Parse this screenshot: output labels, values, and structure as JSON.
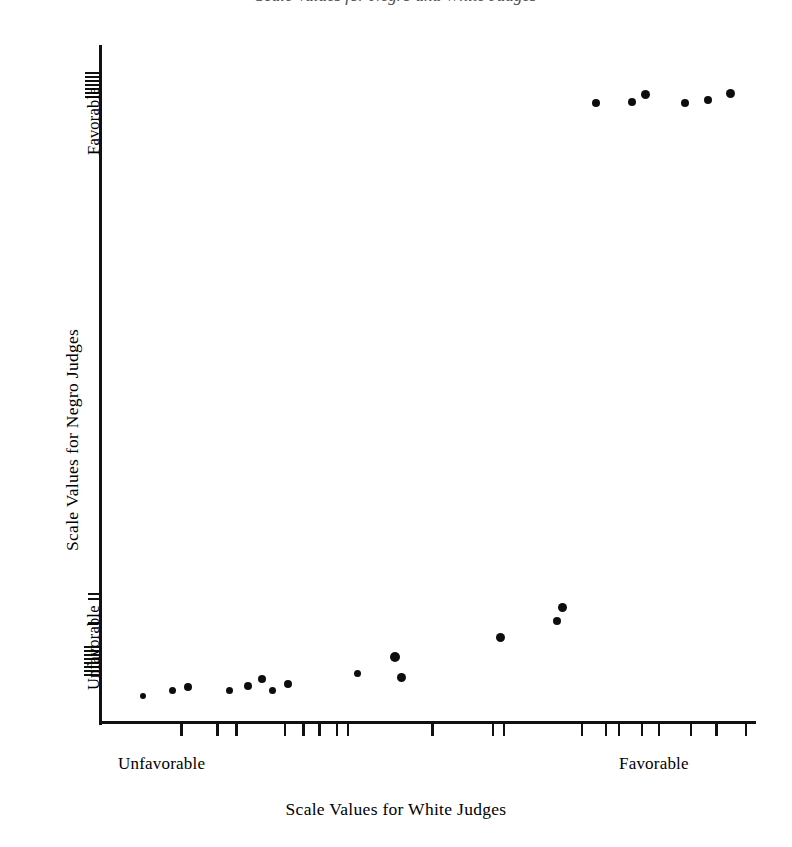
{
  "figure": {
    "title_remnant": "Scale Values for Negro and White Judges",
    "background_color": "#ffffff",
    "ink_color": "#0d0d0d"
  },
  "chart_data": {
    "type": "scatter",
    "title": "",
    "xlabel": "Scale Values for White Judges",
    "ylabel": "Scale Values for Negro Judges",
    "x_tick_labels": [
      "Unfavorable",
      "Favorable"
    ],
    "y_tick_labels": [
      "Unfavorable",
      "Favorable"
    ],
    "xlim": [
      0,
      11
    ],
    "ylim": [
      0,
      11
    ],
    "grid": false,
    "legend": null,
    "x_axis_label_positions": [
      1.1,
      8.6
    ],
    "y_axis_label_positions": [
      0.85,
      9.5
    ],
    "points": [
      {
        "x": 0.68,
        "y": 0.38
      },
      {
        "x": 1.18,
        "y": 0.48
      },
      {
        "x": 1.45,
        "y": 0.53
      },
      {
        "x": 2.14,
        "y": 0.48
      },
      {
        "x": 2.46,
        "y": 0.55
      },
      {
        "x": 2.69,
        "y": 0.66
      },
      {
        "x": 2.87,
        "y": 0.49
      },
      {
        "x": 3.14,
        "y": 0.58
      },
      {
        "x": 4.31,
        "y": 0.75
      },
      {
        "x": 4.94,
        "y": 1.01
      },
      {
        "x": 5.04,
        "y": 0.7
      },
      {
        "x": 6.72,
        "y": 1.35
      },
      {
        "x": 7.68,
        "y": 1.61
      },
      {
        "x": 7.76,
        "y": 1.84
      },
      {
        "x": 8.35,
        "y": 10.12
      },
      {
        "x": 8.94,
        "y": 10.13
      },
      {
        "x": 9.17,
        "y": 10.27
      },
      {
        "x": 9.82,
        "y": 10.12
      },
      {
        "x": 10.21,
        "y": 10.17
      },
      {
        "x": 10.58,
        "y": 10.29
      }
    ],
    "x_ticks": [
      1.2,
      2.69,
      3.46,
      5.49,
      6.25,
      6.92,
      7.64,
      8.1,
      11.57,
      14.09,
      14.55,
      17.78,
      18.77,
      19.3,
      20.25,
      20.95,
      22.29,
      23.34,
      24.56
    ],
    "y_ticks_top": [
      9.83,
      9.95,
      10.07,
      10.19,
      10.31,
      10.43,
      10.55
    ],
    "y_ticks_bottom": [
      2.15,
      2.3,
      1.66,
      0.94,
      0.84,
      0.74,
      0.64,
      0.54,
      0.44,
      0.34,
      0.24
    ]
  },
  "points_px": [
    {
      "x": 143,
      "y": 696
    },
    {
      "x": 172,
      "y": 690
    },
    {
      "x": 188,
      "y": 687
    },
    {
      "x": 229,
      "y": 690
    },
    {
      "x": 248,
      "y": 686
    },
    {
      "x": 262,
      "y": 679
    },
    {
      "x": 272,
      "y": 690
    },
    {
      "x": 288,
      "y": 684
    },
    {
      "x": 357,
      "y": 673
    },
    {
      "x": 395,
      "y": 657
    },
    {
      "x": 401,
      "y": 677
    },
    {
      "x": 500,
      "y": 637
    },
    {
      "x": 557,
      "y": 621
    },
    {
      "x": 562,
      "y": 607
    },
    {
      "x": 596,
      "y": 103
    },
    {
      "x": 632,
      "y": 102
    },
    {
      "x": 645,
      "y": 94
    },
    {
      "x": 685,
      "y": 103
    },
    {
      "x": 708,
      "y": 100
    },
    {
      "x": 730,
      "y": 93
    }
  ],
  "point_sizes_px": [
    6,
    7,
    8,
    7,
    8,
    8,
    7,
    8,
    7,
    10,
    9,
    9,
    8,
    9,
    8,
    8,
    9,
    8,
    8,
    9
  ],
  "x_ticks_px": [
    140,
    196,
    225,
    300,
    329,
    354,
    381,
    398,
    529,
    623,
    640,
    761,
    798,
    818,
    854,
    880,
    930,
    969,
    1015
  ],
  "y_ticks_top_px": [
    72,
    76,
    80,
    84,
    88,
    92,
    96
  ],
  "y_ticks_bottom_px": [
    593,
    598,
    622,
    646,
    650,
    654,
    658,
    662,
    666,
    670,
    674
  ],
  "axes_px": {
    "x0": 99,
    "y_top": 45,
    "y_bottom": 723,
    "x1": 756
  }
}
